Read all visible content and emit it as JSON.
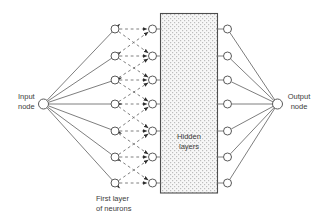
{
  "diagram": {
    "type": "neural-network-figure",
    "labels": {
      "input": {
        "line1": "Input",
        "line2": "node"
      },
      "output": {
        "line1": "Output",
        "line2": "node"
      },
      "first_layer": {
        "line1": "First layer",
        "line2": "of neurons"
      },
      "hidden": {
        "line1": "Hidden",
        "line2": "layers"
      }
    },
    "colors": {
      "background": "#ffffff",
      "edge": "#6f6f6f",
      "node_stroke": "#5a5a5a",
      "node_fill": "#ffffff",
      "box_stroke": "#4d4d4d",
      "box_dot": "#bdbdbd",
      "box_bg": "#f7f7f7",
      "arrow": "#2e2e2e",
      "text": "#3c3c3c"
    },
    "structure": {
      "input_node": {
        "x": 43.5,
        "y": 104,
        "r": 5
      },
      "output_node": {
        "x": 277.5,
        "y": 104,
        "r": 5
      },
      "first_layer_x": 115,
      "pre_hidden_x": 152.5,
      "post_hidden_x": 227.5,
      "row_ys": [
        29,
        56,
        80,
        104,
        131,
        157,
        183
      ],
      "node_r": 4,
      "hidden_box": {
        "x": 160.5,
        "y": 13.5,
        "w": 57,
        "h": 179.5
      },
      "first_layer_count": 7,
      "dashed_connection_offsets": [
        -1,
        0,
        1
      ]
    }
  }
}
